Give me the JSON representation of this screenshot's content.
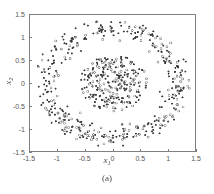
{
  "figure": {
    "caption": "(a)"
  },
  "axes": {
    "xlabel_base": "x",
    "xlabel_sub": "1",
    "ylabel_base": "x",
    "ylabel_sub": "2",
    "xticks": [
      "-1.5",
      "-1",
      "-0.5",
      "0",
      "0.5",
      "1",
      "1.5"
    ],
    "yticks": [
      "1.5",
      "1",
      "0.5",
      "0",
      "-0.5",
      "-1",
      "-1.5"
    ]
  },
  "chart_data": {
    "type": "scatter",
    "title": "",
    "xlabel": "x_1",
    "ylabel": "x_2",
    "xlim": [
      -1.5,
      1.5
    ],
    "ylim": [
      -1.5,
      1.5
    ],
    "xticks": [
      -1.5,
      -1,
      -0.5,
      0,
      0.5,
      1,
      1.5
    ],
    "yticks": [
      -1.5,
      -1,
      -0.5,
      0,
      0.5,
      1,
      1.5
    ],
    "grid": false,
    "legend": null,
    "annotations": [
      "(a)"
    ],
    "marker_size_px": 2.0,
    "series": [
      {
        "name": "inner-disk-filled",
        "marker": "filled-circle",
        "color": "#3a3a3a",
        "n": 168,
        "distribution": {
          "shape": "disk",
          "center": [
            0.02,
            0.0
          ],
          "radius_mean": 0.0,
          "radius_max": 0.62,
          "radius_jitter": 0.0
        }
      },
      {
        "name": "inner-disk-hollow",
        "marker": "open-circle",
        "color": "#7d7d7d",
        "n": 96,
        "distribution": {
          "shape": "disk",
          "center": [
            0.02,
            0.0
          ],
          "radius_mean": 0.0,
          "radius_max": 0.62,
          "radius_jitter": 0.0
        }
      },
      {
        "name": "outer-ring-filled",
        "marker": "filled-circle",
        "color": "#3a3a3a",
        "n": 265,
        "distribution": {
          "shape": "annulus",
          "center": [
            0.0,
            0.0
          ],
          "radius_mean": 1.2,
          "radius_max": 1.42,
          "radius_jitter": 0.115
        }
      },
      {
        "name": "outer-ring-hollow",
        "marker": "open-circle",
        "color": "#7d7d7d",
        "n": 150,
        "distribution": {
          "shape": "annulus",
          "center": [
            0.0,
            0.0
          ],
          "radius_mean": 1.2,
          "radius_max": 1.42,
          "radius_jitter": 0.115
        }
      }
    ]
  },
  "style": {
    "frame_color": "#808080",
    "text_color": "#4a4a4a",
    "background": "#ffffff"
  }
}
